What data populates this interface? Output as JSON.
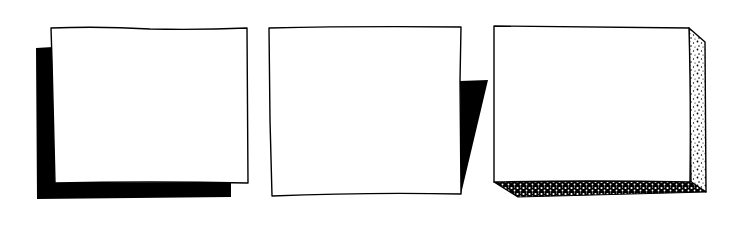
{
  "figure": {
    "panels": [
      {
        "id": "solid-offset-shadow",
        "style": "solid black L-shaped drop shadow offset down-left"
      },
      {
        "id": "wedge-shadow",
        "style": "solid black tapering wedge shadow on the right edge"
      },
      {
        "id": "stippled-extrusion",
        "style": "stippled 3D extrusion on right and bottom sides"
      }
    ],
    "colors": {
      "ink": "#000000",
      "paper": "#ffffff"
    }
  }
}
